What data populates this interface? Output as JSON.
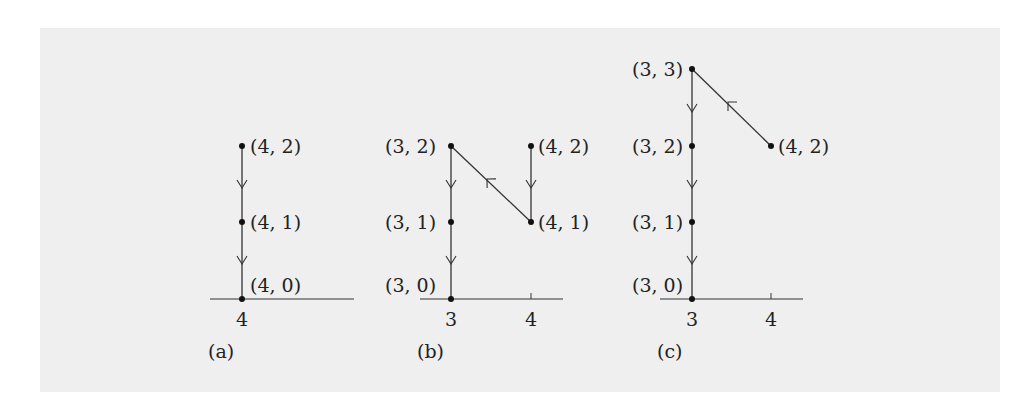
{
  "figure": {
    "panels": [
      {
        "label": "(a)",
        "tick_labels": [
          "4"
        ],
        "points": [
          {
            "label": "(4, 2)",
            "x": 4,
            "y": 2
          },
          {
            "label": "(4, 1)",
            "x": 4,
            "y": 1
          },
          {
            "label": "(4, 0)",
            "x": 4,
            "y": 0
          }
        ],
        "edges": [
          {
            "from": "(4, 2)",
            "to": "(4, 1)"
          },
          {
            "from": "(4, 1)",
            "to": "(4, 0)"
          }
        ]
      },
      {
        "label": "(b)",
        "tick_labels": [
          "3",
          "4"
        ],
        "points": [
          {
            "label": "(3, 2)",
            "x": 3,
            "y": 2
          },
          {
            "label": "(4, 2)",
            "x": 4,
            "y": 2
          },
          {
            "label": "(3, 1)",
            "x": 3,
            "y": 1
          },
          {
            "label": "(4, 1)",
            "x": 4,
            "y": 1
          },
          {
            "label": "(3, 0)",
            "x": 3,
            "y": 0
          }
        ],
        "edges": [
          {
            "from": "(4, 2)",
            "to": "(4, 1)"
          },
          {
            "from": "(4, 1)",
            "to": "(3, 2)"
          },
          {
            "from": "(3, 2)",
            "to": "(3, 1)"
          },
          {
            "from": "(3, 1)",
            "to": "(3, 0)"
          }
        ]
      },
      {
        "label": "(c)",
        "tick_labels": [
          "3",
          "4"
        ],
        "points": [
          {
            "label": "(3, 3)",
            "x": 3,
            "y": 3
          },
          {
            "label": "(3, 2)",
            "x": 3,
            "y": 2
          },
          {
            "label": "(4, 2)",
            "x": 4,
            "y": 2
          },
          {
            "label": "(3, 1)",
            "x": 3,
            "y": 1
          },
          {
            "label": "(3, 0)",
            "x": 3,
            "y": 0
          }
        ],
        "edges": [
          {
            "from": "(4, 2)",
            "to": "(3, 3)"
          },
          {
            "from": "(3, 3)",
            "to": "(3, 2)"
          },
          {
            "from": "(3, 2)",
            "to": "(3, 1)"
          },
          {
            "from": "(3, 1)",
            "to": "(3, 0)"
          }
        ]
      }
    ]
  }
}
